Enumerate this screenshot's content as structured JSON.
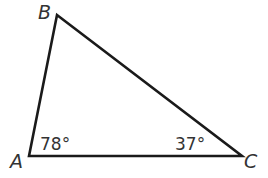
{
  "diagram": {
    "type": "triangle",
    "vertices": [
      {
        "label": "A",
        "x": 29,
        "y": 156
      },
      {
        "label": "B",
        "x": 57,
        "y": 15
      },
      {
        "label": "C",
        "x": 242,
        "y": 156
      }
    ],
    "angles": [
      {
        "vertex": "A",
        "label": "78°"
      },
      {
        "vertex": "C",
        "label": "37°"
      }
    ],
    "stroke_color": "#1a1a1a",
    "text_color": "#333333"
  }
}
